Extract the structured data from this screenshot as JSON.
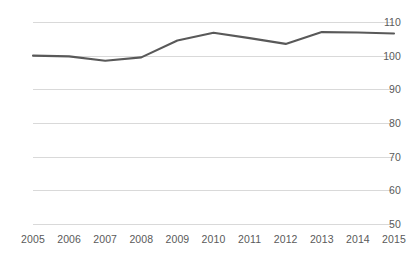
{
  "chart_data": {
    "type": "line",
    "title": "",
    "subtitle": "",
    "xlabel": "",
    "ylabel": "",
    "categories": [
      "2005",
      "2006",
      "2007",
      "2008",
      "2009",
      "2010",
      "2011",
      "2012",
      "2013",
      "2014",
      "2015"
    ],
    "series": [
      {
        "name": "Index",
        "color": "#595959",
        "values": [
          100.0,
          99.8,
          98.5,
          99.5,
          104.5,
          106.8,
          105.2,
          103.5,
          107.0,
          106.9,
          106.6
        ]
      }
    ],
    "ylim": [
      50,
      110
    ],
    "ytick_labels": [
      "110",
      "100",
      "90",
      "80",
      "70",
      "60",
      "50"
    ],
    "ytick_values": [
      110,
      100,
      90,
      80,
      70,
      60,
      50
    ],
    "xtick_labels": [
      "2005",
      "2006",
      "2007",
      "2008",
      "2009",
      "2010",
      "2011",
      "2012",
      "2013",
      "2014",
      "2015"
    ],
    "grid": true,
    "grid_color": "#d9d9d9",
    "legend": "none",
    "background": "#ffffff",
    "tick_label_color": "#5a5a5a"
  }
}
